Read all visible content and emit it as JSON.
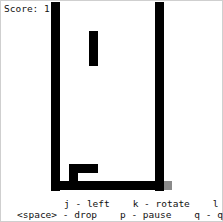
{
  "score": {
    "label": "Score: 1"
  },
  "board": {
    "cell_px": 8.6,
    "wall_color": "#000000",
    "corner_cell_color": "#8a8a8a",
    "falling_piece": "I (vertical)",
    "landed_piece": "J/L"
  },
  "help": {
    "line1": "j - left    k - rotate    l - right",
    "line2": "<space> - drop    p - pause    q - quit"
  }
}
